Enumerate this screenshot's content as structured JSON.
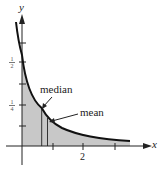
{
  "figure": {
    "type": "probability density diagram",
    "axes": {
      "x_label": "x",
      "y_label": "y",
      "x_tick_labels": [
        {
          "value": 2,
          "label": "2"
        }
      ],
      "x_ticks": [
        1,
        2,
        3
      ],
      "y_tick_labels": [
        {
          "value": 0.5,
          "numerator": "1",
          "denominator": "2"
        },
        {
          "value": 0.25,
          "numerator": "1",
          "denominator": "4"
        }
      ]
    },
    "annotations": {
      "median": "median",
      "mean": "mean"
    },
    "colors": {
      "curve": "#111111",
      "shade": "#c8c8c8",
      "axis": "#222222"
    }
  }
}
